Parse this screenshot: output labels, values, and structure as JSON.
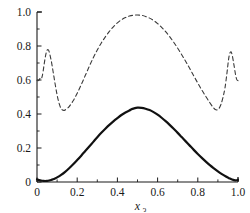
{
  "chart_data": {
    "type": "line",
    "title": "",
    "subtitle": "",
    "xlabel": "x",
    "xlabel_subscript": "3",
    "ylabel": "",
    "xlim": [
      0,
      1
    ],
    "ylim": [
      0,
      1
    ],
    "grid": false,
    "legend": "none",
    "xticks": [
      0,
      0.2,
      0.4,
      0.6,
      0.8,
      1.0
    ],
    "xtick_labels": [
      "0",
      "0.2",
      "0.4",
      "0.6",
      "0.8",
      "1.0"
    ],
    "yticks": [
      0,
      0.2,
      0.4,
      0.6,
      0.8,
      1.0
    ],
    "ytick_labels": [
      "0",
      "0.2",
      "0.4",
      "0.6",
      "0.8",
      "1.0"
    ],
    "axis_color": "#1a1a1a",
    "background_color": "#ffffff",
    "series": [
      {
        "name": "solid-curve",
        "style": "solid",
        "color": "#111111",
        "width": 2.2,
        "x": [
          0.0,
          0.01,
          0.02,
          0.03,
          0.04,
          0.05,
          0.06,
          0.07,
          0.08,
          0.09,
          0.1,
          0.12,
          0.14,
          0.16,
          0.18,
          0.2,
          0.22,
          0.24,
          0.26,
          0.28,
          0.3,
          0.32,
          0.34,
          0.36,
          0.38,
          0.4,
          0.42,
          0.44,
          0.46,
          0.47,
          0.48,
          0.5,
          0.52,
          0.54,
          0.56,
          0.58,
          0.6,
          0.62,
          0.64,
          0.66,
          0.68,
          0.7,
          0.72,
          0.74,
          0.76,
          0.78,
          0.8,
          0.82,
          0.84,
          0.86,
          0.88,
          0.9,
          0.92,
          0.94,
          0.95,
          0.96,
          0.97,
          0.98,
          0.99,
          1.0
        ],
        "y": [
          0.015,
          0.011,
          0.008,
          0.007,
          0.006,
          0.007,
          0.009,
          0.012,
          0.016,
          0.021,
          0.027,
          0.042,
          0.06,
          0.081,
          0.104,
          0.129,
          0.155,
          0.182,
          0.209,
          0.236,
          0.263,
          0.289,
          0.313,
          0.336,
          0.357,
          0.376,
          0.394,
          0.409,
          0.421,
          0.428,
          0.432,
          0.437,
          0.436,
          0.431,
          0.423,
          0.411,
          0.396,
          0.378,
          0.358,
          0.336,
          0.313,
          0.289,
          0.264,
          0.239,
          0.214,
          0.189,
          0.165,
          0.142,
          0.12,
          0.099,
          0.08,
          0.062,
          0.046,
          0.032,
          0.026,
          0.02,
          0.015,
          0.011,
          0.009,
          0.012
        ]
      },
      {
        "name": "dashed-curve",
        "style": "dashed",
        "color": "#3a3a3a",
        "width": 1.1,
        "dash_pattern": "4,3",
        "x": [
          0.0,
          0.005,
          0.01,
          0.015,
          0.02,
          0.025,
          0.03,
          0.035,
          0.04,
          0.045,
          0.05,
          0.055,
          0.06,
          0.07,
          0.08,
          0.09,
          0.1,
          0.11,
          0.12,
          0.13,
          0.14,
          0.16,
          0.18,
          0.2,
          0.22,
          0.24,
          0.26,
          0.28,
          0.3,
          0.32,
          0.34,
          0.36,
          0.38,
          0.4,
          0.42,
          0.44,
          0.46,
          0.48,
          0.5,
          0.52,
          0.54,
          0.56,
          0.58,
          0.6,
          0.62,
          0.64,
          0.66,
          0.68,
          0.7,
          0.72,
          0.74,
          0.76,
          0.78,
          0.8,
          0.82,
          0.84,
          0.86,
          0.875,
          0.885,
          0.895,
          0.905,
          0.915,
          0.925,
          0.935,
          0.945,
          0.952,
          0.958,
          0.965,
          0.972,
          0.98,
          0.988,
          0.994,
          1.0
        ],
        "y": [
          0.598,
          0.596,
          0.6,
          0.608,
          0.604,
          0.618,
          0.648,
          0.688,
          0.726,
          0.757,
          0.775,
          0.778,
          0.768,
          0.718,
          0.65,
          0.578,
          0.512,
          0.462,
          0.432,
          0.422,
          0.424,
          0.444,
          0.478,
          0.522,
          0.572,
          0.626,
          0.68,
          0.731,
          0.777,
          0.818,
          0.854,
          0.886,
          0.913,
          0.936,
          0.954,
          0.967,
          0.976,
          0.981,
          0.982,
          0.98,
          0.974,
          0.964,
          0.95,
          0.932,
          0.91,
          0.884,
          0.855,
          0.822,
          0.787,
          0.749,
          0.709,
          0.667,
          0.624,
          0.582,
          0.541,
          0.503,
          0.466,
          0.441,
          0.428,
          0.424,
          0.432,
          0.456,
          0.496,
          0.552,
          0.64,
          0.712,
          0.752,
          0.766,
          0.742,
          0.688,
          0.63,
          0.602,
          0.596
        ]
      }
    ]
  }
}
